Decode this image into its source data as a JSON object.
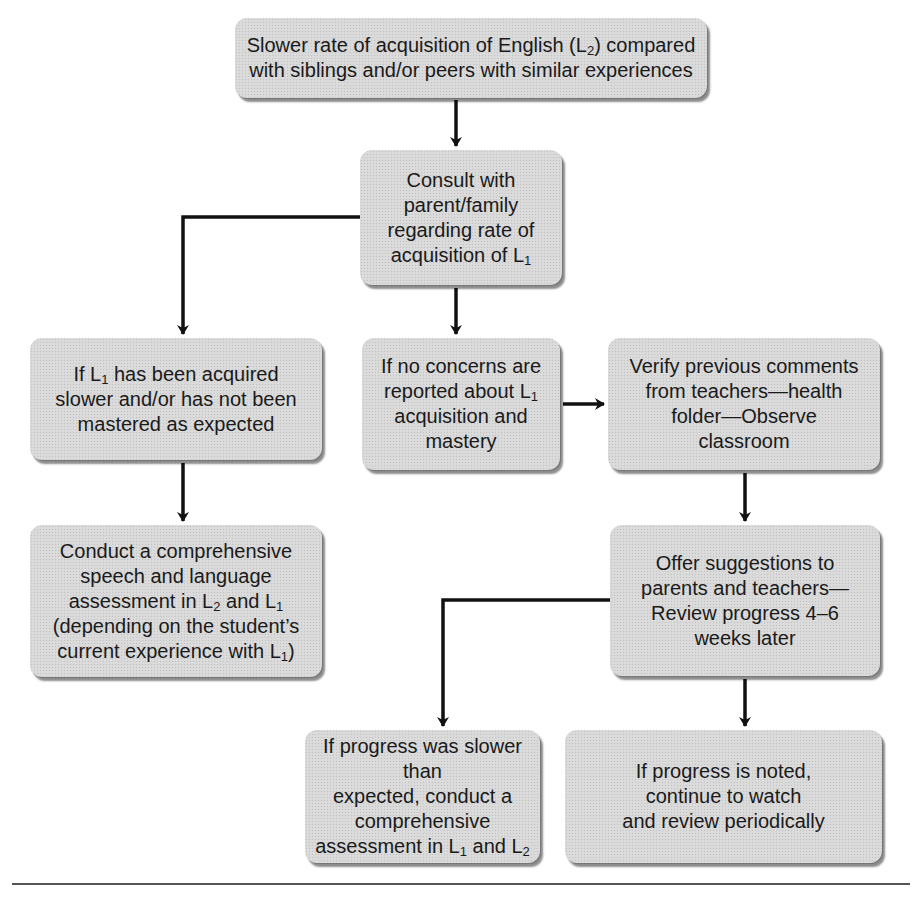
{
  "diagram": {
    "type": "flowchart",
    "nodes": {
      "start": {
        "lines": [
          [
            "Slower rate of acquisition of English (L",
            {
              "sub": "2"
            },
            ") compared"
          ],
          [
            "with siblings and/or peers with similar experiences"
          ]
        ],
        "text": "Slower rate of acquisition of English (L2) compared with siblings and/or peers with similar experiences"
      },
      "consult": {
        "lines": [
          [
            "Consult with"
          ],
          [
            "parent/family"
          ],
          [
            "regarding rate of"
          ],
          [
            "acquisition of L",
            {
              "sub": "1"
            }
          ]
        ],
        "text": "Consult with parent/family regarding rate of acquisition of L1"
      },
      "l1_slower": {
        "lines": [
          [
            "If L",
            {
              "sub": "1"
            },
            " has been acquired"
          ],
          [
            "slower and/or has not been"
          ],
          [
            "mastered as expected"
          ]
        ],
        "text": "If L1 has been acquired slower and/or has not been mastered as expected"
      },
      "no_concerns": {
        "lines": [
          [
            "If no concerns are"
          ],
          [
            "reported about L",
            {
              "sub": "1"
            }
          ],
          [
            "acquisition and"
          ],
          [
            "mastery"
          ]
        ],
        "text": "If no concerns are reported about L1 acquisition and mastery"
      },
      "verify": {
        "lines": [
          [
            "Verify previous comments"
          ],
          [
            "from teachers—health"
          ],
          [
            "folder—Observe"
          ],
          [
            "classroom"
          ]
        ],
        "text": "Verify previous comments from teachers—health folder—Observe classroom"
      },
      "conduct": {
        "lines": [
          [
            "Conduct a comprehensive"
          ],
          [
            "speech and language"
          ],
          [
            "assessment in L",
            {
              "sub": "2"
            },
            " and L",
            {
              "sub": "1"
            }
          ],
          [
            "(depending on the student’s"
          ],
          [
            "current experience with L",
            {
              "sub": "1"
            },
            ")"
          ]
        ],
        "text": "Conduct a comprehensive speech and language assessment in L2 and L1 (depending on the student’s current experience with L1)"
      },
      "offer": {
        "lines": [
          [
            "Offer suggestions to"
          ],
          [
            "parents and teachers—"
          ],
          [
            "Review progress 4–6"
          ],
          [
            "weeks later"
          ]
        ],
        "text": "Offer suggestions to parents and teachers—Review progress 4–6 weeks later"
      },
      "progress_slower": {
        "lines": [
          [
            "If progress was slower than"
          ],
          [
            "expected, conduct a"
          ],
          [
            "comprehensive"
          ],
          [
            "assessment in L",
            {
              "sub": "1"
            },
            " and L",
            {
              "sub": "2"
            }
          ]
        ],
        "text": "If progress was slower than expected, conduct a comprehensive assessment in L1 and L2"
      },
      "progress_noted": {
        "lines": [
          [
            "If progress is noted,"
          ],
          [
            "continue to watch"
          ],
          [
            "and review periodically"
          ]
        ],
        "text": "If progress is noted, continue to watch and review periodically"
      }
    },
    "edges": [
      {
        "from": "start",
        "to": "consult"
      },
      {
        "from": "consult",
        "to": "l1_slower"
      },
      {
        "from": "consult",
        "to": "no_concerns"
      },
      {
        "from": "no_concerns",
        "to": "verify"
      },
      {
        "from": "l1_slower",
        "to": "conduct"
      },
      {
        "from": "verify",
        "to": "offer"
      },
      {
        "from": "offer",
        "to": "progress_slower"
      },
      {
        "from": "offer",
        "to": "progress_noted"
      }
    ],
    "colors": {
      "box_fill": "#d9d9d9",
      "line": "#111111",
      "text": "#1a1a1a",
      "rule": "#555555"
    }
  }
}
